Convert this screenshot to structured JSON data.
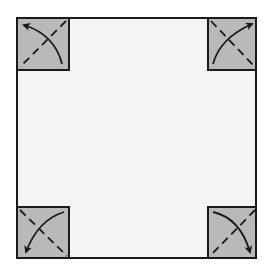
{
  "diagram": {
    "colors": {
      "paper": "#f4f4f4",
      "flap": "#b9b9b9",
      "line": "#1a1a1a"
    },
    "square": {
      "x": 17,
      "y": 18,
      "w": 239,
      "h": 240
    },
    "corners": [
      {
        "name": "top-left",
        "direction": "up-left"
      },
      {
        "name": "top-right",
        "direction": "up-right"
      },
      {
        "name": "bottom-left",
        "direction": "down-left"
      },
      {
        "name": "bottom-right",
        "direction": "down-right"
      }
    ]
  }
}
